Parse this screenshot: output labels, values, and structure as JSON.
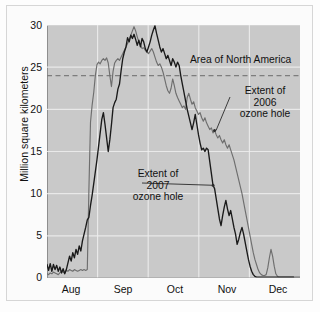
{
  "figure": {
    "background_color": "#fbfbfb",
    "plot_background_color": "#c9c9c9",
    "gridline_color": "#efefef"
  },
  "chart_data": {
    "type": "line",
    "title": "",
    "xlabel": "",
    "ylabel": "Million square kilometers",
    "xlim": [
      0,
      153
    ],
    "ylim": [
      0,
      30
    ],
    "yticks": [
      0,
      5,
      10,
      15,
      20,
      25,
      30
    ],
    "xticks": [
      "Aug",
      "Sep",
      "Oct",
      "Nov",
      "Dec"
    ],
    "grid": true,
    "legend_position": "none",
    "annotations": [
      {
        "name": "north-america-reference",
        "text": "Area of North America",
        "value": 24,
        "style": "dashed-horizontal-line",
        "color": "#8e8e8e"
      },
      {
        "name": "extent-2006-callout",
        "text": "Extent of\n2006\nozone hole",
        "series": "2006"
      },
      {
        "name": "extent-2007-callout",
        "text": "Extent of\n2007\nozone hole",
        "series": "2007"
      }
    ],
    "reference_line": {
      "label": "Area of North America",
      "value": 24
    },
    "series": [
      {
        "name": "Extent of 2006 ozone hole",
        "color": "#6e6e6e",
        "values": [
          0.5,
          0.4,
          0.6,
          0.5,
          0.7,
          0.6,
          0.5,
          0.4,
          0.6,
          0.8,
          0.7,
          0.6,
          0.9,
          0.8,
          1.0,
          0.9,
          0.8,
          1.0,
          0.9,
          0.8,
          0.9,
          1.0,
          0.9,
          1.0,
          0.9,
          1.0,
          10.5,
          18.5,
          20.5,
          22.0,
          24.0,
          25.3,
          25.6,
          25.4,
          25.8,
          26.0,
          25.8,
          26.1,
          25.5,
          24.0,
          22.7,
          24.5,
          25.5,
          25.8,
          26.0,
          25.8,
          26.2,
          26.6,
          27.0,
          27.4,
          27.8,
          28.2,
          28.8,
          29.3,
          29.8,
          29.3,
          28.6,
          28.0,
          27.6,
          27.2,
          27.3,
          27.0,
          26.8,
          26.6,
          26.9,
          27.2,
          26.8,
          26.2,
          25.6,
          25.2,
          25.4,
          25.0,
          24.4,
          23.6,
          22.8,
          22.2,
          21.9,
          22.5,
          23.6,
          22.8,
          21.9,
          21.4,
          21.0,
          20.6,
          20.2,
          20.4,
          20.0,
          21.4,
          21.9,
          21.2,
          20.6,
          20.9,
          20.2,
          19.8,
          19.4,
          19.6,
          19.0,
          18.6,
          19.0,
          18.4,
          18.0,
          17.6,
          17.8,
          17.2,
          17.5,
          17.0,
          16.6,
          16.9,
          16.4,
          16.0,
          16.4,
          15.8,
          15.4,
          15.8,
          15.2,
          14.6,
          14.0,
          13.2,
          12.4,
          11.6,
          10.8,
          10.0,
          9.0,
          8.0,
          7.0,
          6.0,
          5.0,
          4.0,
          3.0,
          2.2,
          1.6,
          1.0,
          0.6,
          0.4,
          0.3,
          0.3,
          0.4,
          1.2,
          2.4,
          3.4,
          2.6,
          1.4,
          0.5,
          0.2,
          0.1,
          0.1,
          0.1,
          0.1,
          0.1,
          0.1,
          0.1,
          0.1,
          0.1,
          0.1,
          0.1,
          0.1,
          0.1,
          0.1
        ]
      },
      {
        "name": "Extent of 2007 ozone hole",
        "color": "#1a1a1a",
        "values": [
          1.6,
          0.9,
          1.7,
          0.8,
          1.6,
          1.0,
          1.5,
          0.8,
          1.3,
          0.6,
          1.1,
          0.5,
          1.0,
          1.8,
          2.6,
          2.0,
          3.0,
          2.4,
          3.4,
          2.8,
          3.8,
          3.2,
          4.4,
          5.2,
          6.0,
          6.9,
          7.2,
          8.6,
          9.8,
          11.2,
          12.6,
          14.0,
          15.6,
          17.2,
          18.8,
          19.6,
          18.2,
          16.6,
          15.0,
          16.4,
          18.2,
          20.2,
          20.8,
          21.2,
          22.4,
          23.0,
          24.6,
          26.0,
          26.8,
          27.4,
          28.5,
          28.0,
          28.8,
          28.4,
          28.9,
          28.3,
          27.6,
          28.2,
          27.4,
          28.4,
          28.0,
          27.2,
          26.8,
          27.4,
          28.0,
          28.8,
          29.4,
          29.9,
          29.0,
          28.2,
          27.4,
          26.8,
          27.2,
          26.6,
          26.0,
          26.4,
          25.8,
          25.2,
          26.0,
          25.6,
          25.0,
          25.6,
          25.2,
          24.0,
          23.0,
          22.0,
          21.0,
          20.0,
          19.2,
          18.4,
          17.6,
          18.4,
          19.4,
          18.2,
          17.0,
          16.0,
          15.2,
          15.4,
          15.0,
          15.4,
          15.2,
          13.8,
          12.4,
          11.0,
          10.6,
          9.4,
          8.2,
          7.0,
          6.2,
          7.4,
          8.4,
          9.2,
          8.2,
          7.4,
          8.0,
          7.0,
          6.0,
          5.2,
          4.0,
          4.6,
          5.4,
          6.0,
          5.2,
          4.2,
          3.2,
          2.2,
          1.4,
          0.8,
          0.4,
          0.2,
          0.1,
          0.1,
          0.1,
          0.1,
          0.1,
          0.1,
          0.1,
          0.1,
          0.1,
          0.1,
          0.1,
          0.1,
          0.1,
          0.1,
          0.1,
          0.1,
          0.1,
          0.1,
          0.1,
          0.1,
          0.1,
          0.1,
          0.1,
          0.1
        ]
      }
    ]
  },
  "axis": {
    "y_label": "Million square kilometers",
    "y_ticks": [
      "30",
      "25",
      "20",
      "15",
      "10",
      "5",
      "0"
    ],
    "x_ticks": [
      "Aug",
      "Sep",
      "Oct",
      "Nov",
      "Dec"
    ]
  },
  "labels": {
    "north_america": "Area of North America",
    "extent_2006": "Extent of\n2006\nozone hole",
    "extent_2007": "Extent of\n2007\nozone hole"
  }
}
